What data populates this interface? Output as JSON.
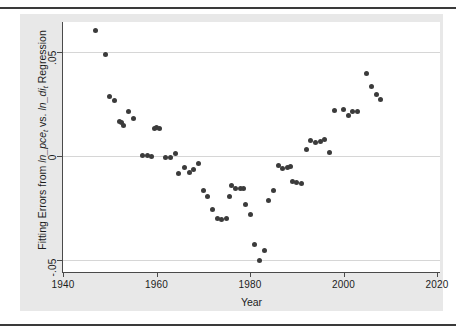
{
  "figure": {
    "background_color": "#e8e8e8",
    "canvas_color": "#ffffff",
    "marker_color": "#3b3b3b",
    "grid_color": "#d6d6d6",
    "axis_color": "#4a4a4a"
  },
  "axes": {
    "x_title": "Year",
    "y_title_parts": {
      "lead": "Fitting Errors from ",
      "var1": "ln_pce",
      "var1_sub": "t",
      "mid": " vs. ",
      "var2": "ln_di",
      "var2_sub": "t",
      "tail": " Regression"
    },
    "y_title_plain": "Fitting Errors from ln_pce_t vs. ln_di_t Regression",
    "x_ticks": [
      "1940",
      "1960",
      "1980",
      "2000",
      "2020"
    ],
    "y_ticks": [
      ".05",
      "0",
      "-.05"
    ]
  },
  "chart_data": {
    "type": "scatter",
    "title": "",
    "xlabel": "Year",
    "ylabel": "Fitting Errors from ln_pce_t vs. ln_di_t Regression",
    "xlim": [
      1940,
      2020
    ],
    "ylim": [
      -0.055,
      0.065
    ],
    "xticks": [
      1940,
      1960,
      1980,
      2000,
      2020
    ],
    "yticks": [
      -0.05,
      0,
      0.05
    ],
    "grid": "horizontal",
    "legend": "none",
    "series": [
      {
        "name": "Fitting errors",
        "x": [
          1947,
          1949,
          1950,
          1951,
          1952,
          1952.6,
          1953,
          1954,
          1955,
          1957,
          1958,
          1959,
          1959.6,
          1960,
          1960.6,
          1962,
          1963,
          1964,
          1964.6,
          1966,
          1967,
          1968,
          1969,
          1970,
          1971,
          1972,
          1973,
          1974,
          1975,
          1975.6,
          1976,
          1977,
          1978,
          1978.6,
          1979,
          1980,
          1981,
          1982,
          1983,
          1984,
          1985,
          1986,
          1987,
          1988,
          1988.6,
          1989,
          1990,
          1991,
          1992,
          1993,
          1994,
          1995,
          1996,
          1997,
          1998,
          2000,
          2001,
          2002,
          2003,
          2005,
          2006,
          2007,
          2008
        ],
        "y": [
          0.0605,
          0.0487,
          0.0288,
          0.0265,
          0.0168,
          0.0163,
          0.0148,
          0.0212,
          0.0182,
          0.0002,
          0.0001,
          0.0,
          0.0131,
          0.0136,
          0.0133,
          -0.0007,
          -0.0008,
          0.0014,
          -0.0082,
          -0.0055,
          -0.0078,
          -0.0065,
          -0.0038,
          -0.0166,
          -0.0196,
          -0.0255,
          -0.0302,
          -0.0303,
          -0.03,
          -0.0194,
          -0.014,
          -0.0158,
          -0.0155,
          -0.0154,
          -0.0235,
          -0.0279,
          -0.0426,
          -0.05,
          -0.0456,
          -0.0215,
          -0.0168,
          -0.0048,
          -0.0059,
          -0.0056,
          -0.0052,
          -0.0121,
          -0.0125,
          -0.0131,
          0.003,
          0.0076,
          0.0063,
          0.0069,
          0.0078,
          0.0019,
          0.0218,
          0.0224,
          0.0195,
          0.0215,
          0.0214,
          0.0396,
          0.0335,
          0.0298,
          0.027
        ],
        "marker": "circle",
        "marker_size": 5,
        "color": "#3b3b3b"
      }
    ]
  }
}
